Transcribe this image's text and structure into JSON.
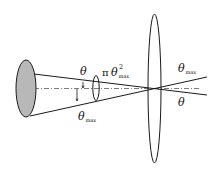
{
  "diagram": {
    "type": "optics-cone-lens",
    "labels": {
      "theta_inner": "θ",
      "pi_symbol": "π",
      "theta_sq": "θ",
      "sq_sup": "2",
      "sq_sub": "max",
      "theta_max_left": "θ",
      "theta_max_left_sub": "max",
      "theta_max_right": "θ",
      "theta_max_right_sub": "max",
      "theta_right": "θ"
    },
    "colors": {
      "source_fill": "#b8b8b8",
      "stroke": "#1a1a1a",
      "background": "#ffffff"
    }
  }
}
